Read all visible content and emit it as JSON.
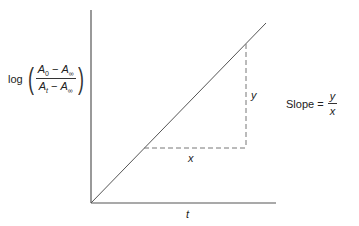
{
  "diagram": {
    "type": "linear-plot",
    "y_axis_label": {
      "prefix": "log",
      "numerator": {
        "A": "A",
        "sub1": "0",
        "minus": " − ",
        "A2": "A",
        "sub2": "∞"
      },
      "denominator": {
        "A": "A",
        "sub1": "t",
        "minus": " − ",
        "A2": "A",
        "sub2": "∞"
      }
    },
    "x_axis_label": "t",
    "triangle": {
      "run_label": "x",
      "rise_label": "y"
    },
    "slope_annotation": {
      "label": "Slope =",
      "numerator": "y",
      "denominator": "x"
    },
    "geometry": {
      "origin": [
        91,
        203
      ],
      "y_axis_top": [
        91,
        10
      ],
      "x_axis_end": [
        276,
        203
      ],
      "line_end": [
        266,
        23
      ],
      "dash_corner": [
        246,
        148
      ],
      "dash_top": [
        246,
        44
      ],
      "dash_left": [
        144,
        148
      ]
    },
    "colors": {
      "axis": "#555555",
      "line": "#555555",
      "dash": "#777777",
      "text": "#222222"
    }
  }
}
